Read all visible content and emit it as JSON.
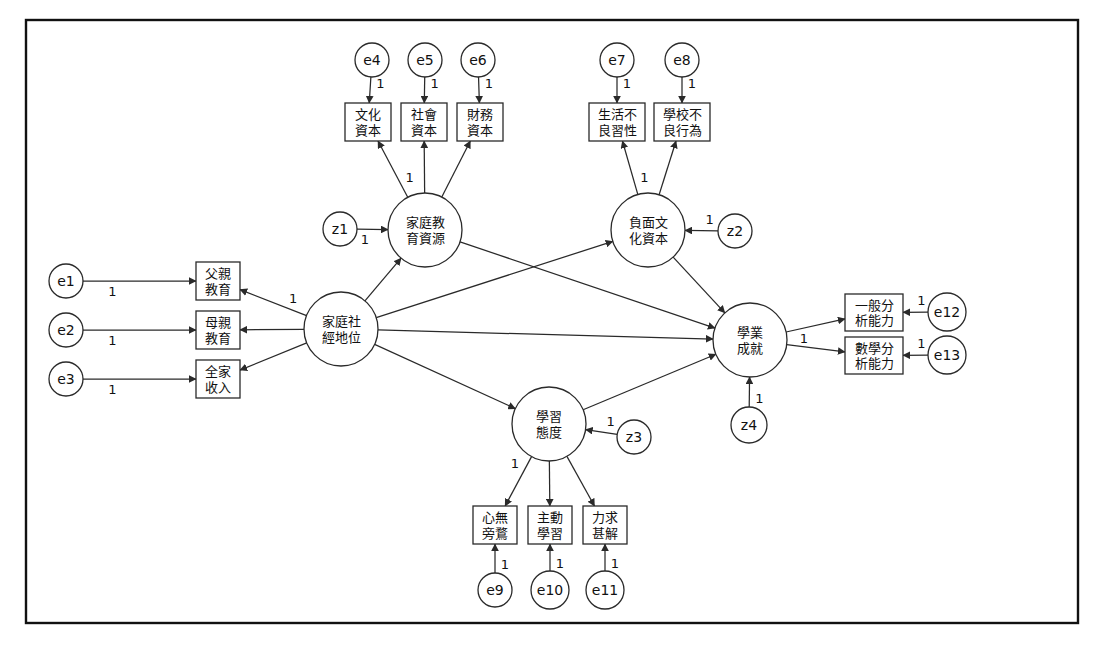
{
  "diagram": {
    "type": "structural-equation-model-path-diagram",
    "title": "",
    "frame": {
      "x": 26,
      "y": 20,
      "width": 1052,
      "height": 603
    },
    "loading_label": "1",
    "latent_variables": [
      {
        "id": "fam_edu_res",
        "label_lines": [
          "家庭教",
          "育資源"
        ],
        "cx": 425,
        "cy": 230,
        "r": 37
      },
      {
        "id": "neg_culture",
        "label_lines": [
          "負面文",
          "化資本"
        ],
        "cx": 648,
        "cy": 230,
        "r": 37
      },
      {
        "id": "ses",
        "label_lines": [
          "家庭社",
          "經地位"
        ],
        "cx": 341,
        "cy": 329,
        "r": 37
      },
      {
        "id": "achievement",
        "label_lines": [
          "學業",
          "成就"
        ],
        "cx": 750,
        "cy": 340,
        "r": 37
      },
      {
        "id": "learn_attitude",
        "label_lines": [
          "學習",
          "態度"
        ],
        "cx": 549,
        "cy": 424,
        "r": 37
      }
    ],
    "observed_variables": [
      {
        "id": "cultural_capital",
        "label_lines": [
          "文化",
          "資本"
        ],
        "x": 345,
        "y": 103,
        "w": 46,
        "h": 38
      },
      {
        "id": "social_capital",
        "label_lines": [
          "社會",
          "資本"
        ],
        "x": 401,
        "y": 103,
        "w": 46,
        "h": 38
      },
      {
        "id": "financial_capital",
        "label_lines": [
          "財務",
          "資本"
        ],
        "x": 457,
        "y": 103,
        "w": 46,
        "h": 38
      },
      {
        "id": "bad_life_habit",
        "label_lines": [
          "生活不",
          "良習性"
        ],
        "x": 589,
        "y": 103,
        "w": 56,
        "h": 38
      },
      {
        "id": "school_misbehavior",
        "label_lines": [
          "學校不",
          "良行為"
        ],
        "x": 654,
        "y": 103,
        "w": 56,
        "h": 38
      },
      {
        "id": "father_education",
        "label_lines": [
          "父親",
          "教育"
        ],
        "x": 196,
        "y": 262,
        "w": 44,
        "h": 38
      },
      {
        "id": "mother_education",
        "label_lines": [
          "母親",
          "教育"
        ],
        "x": 196,
        "y": 311,
        "w": 44,
        "h": 38
      },
      {
        "id": "family_income",
        "label_lines": [
          "全家",
          "收入"
        ],
        "x": 196,
        "y": 360,
        "w": 44,
        "h": 38
      },
      {
        "id": "general_analysis",
        "label_lines": [
          "一般分",
          "析能力"
        ],
        "x": 845,
        "y": 294,
        "w": 58,
        "h": 37
      },
      {
        "id": "math_analysis",
        "label_lines": [
          "數學分",
          "析能力"
        ],
        "x": 845,
        "y": 337,
        "w": 58,
        "h": 37
      },
      {
        "id": "focus_no_distract",
        "label_lines": [
          "心無",
          "旁鶩"
        ],
        "x": 473,
        "y": 506,
        "w": 44,
        "h": 38
      },
      {
        "id": "active_learning",
        "label_lines": [
          "主動",
          "學習"
        ],
        "x": 528,
        "y": 506,
        "w": 44,
        "h": 38
      },
      {
        "id": "seek_understanding",
        "label_lines": [
          "力求",
          "甚解"
        ],
        "x": 583,
        "y": 506,
        "w": 44,
        "h": 38
      }
    ],
    "error_terms": [
      {
        "id": "e1",
        "label": "e1",
        "cx": 66,
        "cy": 281,
        "r": 17
      },
      {
        "id": "e2",
        "label": "e2",
        "cx": 66,
        "cy": 330,
        "r": 17
      },
      {
        "id": "e3",
        "label": "e3",
        "cx": 66,
        "cy": 379,
        "r": 17
      },
      {
        "id": "e4",
        "label": "e4",
        "cx": 372,
        "cy": 60,
        "r": 17
      },
      {
        "id": "e5",
        "label": "e5",
        "cx": 425,
        "cy": 60,
        "r": 17
      },
      {
        "id": "e6",
        "label": "e6",
        "cx": 478,
        "cy": 60,
        "r": 17
      },
      {
        "id": "e7",
        "label": "e7",
        "cx": 617,
        "cy": 60,
        "r": 17
      },
      {
        "id": "e8",
        "label": "e8",
        "cx": 682,
        "cy": 60,
        "r": 17
      },
      {
        "id": "e9",
        "label": "e9",
        "cx": 495,
        "cy": 590,
        "r": 17
      },
      {
        "id": "e10",
        "label": "e10",
        "cx": 550,
        "cy": 590,
        "r": 19
      },
      {
        "id": "e11",
        "label": "e11",
        "cx": 605,
        "cy": 590,
        "r": 19
      },
      {
        "id": "e12",
        "label": "e12",
        "cx": 947,
        "cy": 312,
        "r": 19
      },
      {
        "id": "e13",
        "label": "e13",
        "cx": 947,
        "cy": 355,
        "r": 19
      }
    ],
    "disturbance_terms": [
      {
        "id": "z1",
        "label": "z1",
        "cx": 340,
        "cy": 229,
        "r": 17
      },
      {
        "id": "z2",
        "label": "z2",
        "cx": 735,
        "cy": 231,
        "r": 17
      },
      {
        "id": "z3",
        "label": "z3",
        "cx": 634,
        "cy": 437,
        "r": 17
      },
      {
        "id": "z4",
        "label": "z4",
        "cx": 749,
        "cy": 425,
        "r": 18
      }
    ],
    "measurement_paths": [
      {
        "from": "e4",
        "to": "cultural_capital",
        "label": "1"
      },
      {
        "from": "e5",
        "to": "social_capital",
        "label": "1"
      },
      {
        "from": "e6",
        "to": "financial_capital",
        "label": "1"
      },
      {
        "from": "e7",
        "to": "bad_life_habit",
        "label": "1"
      },
      {
        "from": "e8",
        "to": "school_misbehavior",
        "label": "1"
      },
      {
        "from": "e1",
        "to": "father_education",
        "label": "1"
      },
      {
        "from": "e2",
        "to": "mother_education",
        "label": "1"
      },
      {
        "from": "e3",
        "to": "family_income",
        "label": "1"
      },
      {
        "from": "e9",
        "to": "focus_no_distract",
        "label": "1"
      },
      {
        "from": "e10",
        "to": "active_learning",
        "label": "1"
      },
      {
        "from": "e11",
        "to": "seek_understanding",
        "label": "1"
      },
      {
        "from": "e12",
        "to": "general_analysis",
        "label": "1"
      },
      {
        "from": "e13",
        "to": "math_analysis",
        "label": "1"
      },
      {
        "from": "fam_edu_res",
        "to": "cultural_capital",
        "label": "1"
      },
      {
        "from": "fam_edu_res",
        "to": "social_capital",
        "label": ""
      },
      {
        "from": "fam_edu_res",
        "to": "financial_capital",
        "label": ""
      },
      {
        "from": "neg_culture",
        "to": "bad_life_habit",
        "label": "1"
      },
      {
        "from": "neg_culture",
        "to": "school_misbehavior",
        "label": ""
      },
      {
        "from": "ses",
        "to": "father_education",
        "label": "1"
      },
      {
        "from": "ses",
        "to": "mother_education",
        "label": ""
      },
      {
        "from": "ses",
        "to": "family_income",
        "label": ""
      },
      {
        "from": "learn_attitude",
        "to": "focus_no_distract",
        "label": "1"
      },
      {
        "from": "learn_attitude",
        "to": "active_learning",
        "label": ""
      },
      {
        "from": "learn_attitude",
        "to": "seek_understanding",
        "label": ""
      },
      {
        "from": "achievement",
        "to": "general_analysis",
        "label": "1"
      },
      {
        "from": "achievement",
        "to": "math_analysis",
        "label": ""
      }
    ],
    "structural_paths": [
      {
        "from": "ses",
        "to": "fam_edu_res",
        "label": ""
      },
      {
        "from": "ses",
        "to": "neg_culture",
        "label": ""
      },
      {
        "from": "ses",
        "to": "learn_attitude",
        "label": ""
      },
      {
        "from": "ses",
        "to": "achievement",
        "label": ""
      },
      {
        "from": "fam_edu_res",
        "to": "achievement",
        "label": ""
      },
      {
        "from": "neg_culture",
        "to": "achievement",
        "label": ""
      },
      {
        "from": "learn_attitude",
        "to": "achievement",
        "label": ""
      }
    ],
    "disturbance_paths": [
      {
        "from": "z1",
        "to": "fam_edu_res",
        "label": "1"
      },
      {
        "from": "z2",
        "to": "neg_culture",
        "label": "1"
      },
      {
        "from": "z3",
        "to": "learn_attitude",
        "label": "1"
      },
      {
        "from": "z4",
        "to": "achievement",
        "label": "1"
      }
    ]
  }
}
